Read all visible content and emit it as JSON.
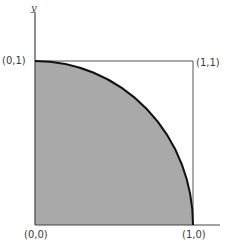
{
  "diagram": {
    "axis_label_y": "y",
    "corners": {
      "origin": "(0,0)",
      "top_left": "(0,1)",
      "top_right": "(1,1)",
      "bottom_right": "(1,0)"
    },
    "colors": {
      "fill": "#a9a9a9",
      "arc": "#111111",
      "square_stroke": "#555555",
      "axis": "#444444",
      "text": "#3a3a3a"
    }
  }
}
